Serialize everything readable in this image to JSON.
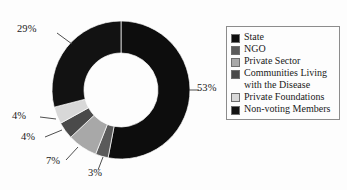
{
  "chart_data": {
    "type": "pie",
    "variant": "donut",
    "title": "",
    "xlabel": "",
    "ylabel": "",
    "legend_position": "right",
    "grid": false,
    "units": "percent",
    "start_angle_deg": 0,
    "direction": "clockwise",
    "hole_ratio": 0.54,
    "categories": [
      "State",
      "NGO",
      "Private Sector",
      "Communities Living with the Disease",
      "Private Foundations",
      "Non-voting Members"
    ],
    "values": [
      53,
      3,
      7,
      4,
      4,
      29
    ],
    "data_labels": [
      "53%",
      "3%",
      "7%",
      "4%",
      "4%",
      "29%"
    ],
    "colors": [
      "#0d0d0d",
      "#5a5a5a",
      "#a8a8a8",
      "#4a4a4a",
      "#d8d8d8",
      "#121212"
    ],
    "total": 100
  },
  "labels": {
    "state": "53%",
    "ngo": "3%",
    "private_sector": "7%",
    "communities": "4%",
    "private_foundations": "4%",
    "non_voting": "29%"
  },
  "legend": {
    "items": [
      {
        "label": "State",
        "color": "#0d0d0d"
      },
      {
        "label": "NGO",
        "color": "#5a5a5a"
      },
      {
        "label": "Private Sector",
        "color": "#a8a8a8"
      },
      {
        "label": "Communities Living\nwith the Disease",
        "color": "#4a4a4a"
      },
      {
        "label": "Private Foundations",
        "color": "#d8d8d8"
      },
      {
        "label": "Non-voting Members",
        "color": "#121212"
      }
    ]
  }
}
